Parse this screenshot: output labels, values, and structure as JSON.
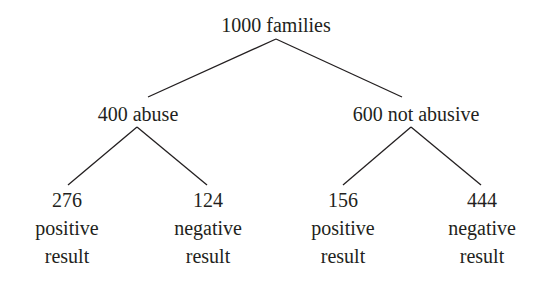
{
  "tree": {
    "root": {
      "label": "1000 families"
    },
    "branches": [
      {
        "label": "400 abuse",
        "children": [
          {
            "count": "276",
            "line1": "positive",
            "line2": "result"
          },
          {
            "count": "124",
            "line1": "negative",
            "line2": "result"
          }
        ]
      },
      {
        "label": "600 not abusive",
        "children": [
          {
            "count": "156",
            "line1": "positive",
            "line2": "result"
          },
          {
            "count": "444",
            "line1": "negative",
            "line2": "result"
          }
        ]
      }
    ]
  },
  "colors": {
    "text": "#231f20",
    "line": "#231f20",
    "background": "#ffffff"
  }
}
